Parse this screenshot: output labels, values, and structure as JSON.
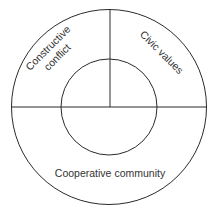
{
  "diagram": {
    "type": "concentric-circle-segments",
    "colors": {
      "stroke": "#2a2a2a",
      "text": "#333333",
      "background": "#ffffff"
    },
    "segments": [
      {
        "id": "top-left",
        "label_line1": "Constructive",
        "label_line2": "conflict"
      },
      {
        "id": "top-right",
        "label": "Civic values"
      },
      {
        "id": "bottom",
        "label": "Cooperative community"
      }
    ],
    "center": {
      "label": ""
    }
  }
}
